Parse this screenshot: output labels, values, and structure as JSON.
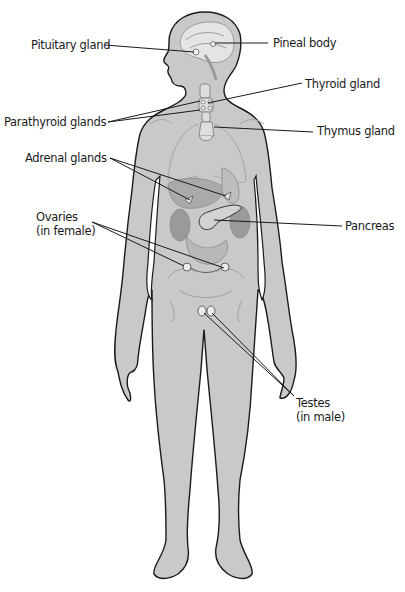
{
  "diagram": {
    "type": "anatomical-illustration",
    "colors": {
      "body_fill": "#c9c9c9",
      "outline": "#1a1a1a",
      "organ_fill": "#b4b4b4",
      "organ_dark": "#9a9a9a",
      "gland_fill": "#e2e2e2",
      "leader_line": "#1a1a1a",
      "text": "#1a1a1a",
      "background": "#ffffff"
    },
    "labels": {
      "pituitary": "Pituitary gland",
      "pineal": "Pineal body",
      "thyroid": "Thyroid gland",
      "parathyroid": "Parathyroid glands",
      "thymus": "Thymus gland",
      "adrenal": "Adrenal glands",
      "pancreas": "Pancreas",
      "ovaries_line1": "Ovaries",
      "ovaries_line2": "(in female)",
      "testes_line1": "Testes",
      "testes_line2": "(in male)"
    }
  }
}
